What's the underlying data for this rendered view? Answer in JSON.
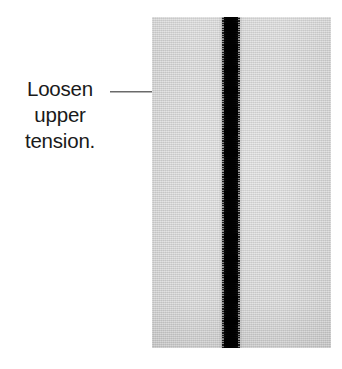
{
  "figure": {
    "type": "sewing-instruction-photo",
    "caption_lines": [
      "Loosen",
      "upper",
      "tension."
    ],
    "caption_full_text": "Loosen upper tension.",
    "annotation": {
      "kind": "leader-line-with-arrow",
      "direction": "right",
      "points_to": "seam-stitch-line"
    },
    "photo": {
      "subject": "gray woven fabric with a dark vertical machine seam",
      "fabric_color": "#d2d2d2",
      "seam_color": "#000000",
      "seam_description": "dense vertical column of horizontal stitches running the full height of the fabric",
      "background_color": "#ffffff"
    }
  }
}
